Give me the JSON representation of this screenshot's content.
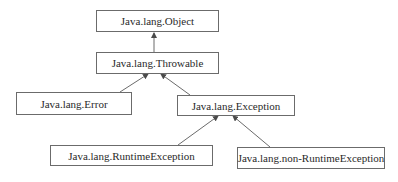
{
  "diagram": {
    "type": "class-hierarchy",
    "nodes": {
      "object": {
        "label": "Java.lang.Object"
      },
      "throwable": {
        "label": "Java.lang.Throwable"
      },
      "error": {
        "label": "Java.lang.Error"
      },
      "exception": {
        "label": "Java.lang.Exception"
      },
      "runtime_exception": {
        "label": "Java.lang.RuntimeException"
      },
      "non_runtime_exception": {
        "label": "Java.lang.non-RuntimeException"
      }
    },
    "edges": [
      {
        "from": "Java.lang.Throwable",
        "to": "Java.lang.Object"
      },
      {
        "from": "Java.lang.Error",
        "to": "Java.lang.Throwable"
      },
      {
        "from": "Java.lang.Exception",
        "to": "Java.lang.Throwable"
      },
      {
        "from": "Java.lang.RuntimeException",
        "to": "Java.lang.Exception"
      },
      {
        "from": "Java.lang.non-RuntimeException",
        "to": "Java.lang.Exception"
      }
    ],
    "colors": {
      "stroke": "#6b6b6b",
      "text": "#2a2a2a",
      "background": "#ffffff"
    }
  }
}
